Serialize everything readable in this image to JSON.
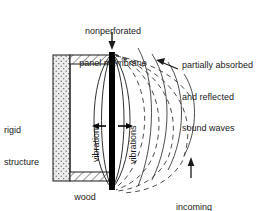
{
  "figure": {
    "title_label": "nonperforated\npanel membrane",
    "background_color": "#ffffff",
    "line_color": "#1a1a1a",
    "membrane_color": "#000000",
    "structure_fill": "#e8e8e8"
  },
  "labels": {
    "membrane": {
      "line1": "nonperforated",
      "line2": "panel membrane"
    },
    "reflected": {
      "line1": "partially absorbed",
      "line2": "and reflected",
      "line3": "sound waves"
    },
    "rigid": {
      "line1": "rigid",
      "line2": "structure"
    },
    "incoming": {
      "line1": "incoming",
      "line2": "sound waves"
    },
    "wood": "wood",
    "vibrations_left": "vibrations",
    "vibrations_right": "vibrations"
  },
  "components": {
    "rigid_structure": "rigid-structure-wall",
    "wood_top": "wood-frame-top",
    "wood_bottom": "wood-frame-bottom",
    "membrane": "panel-membrane-bar",
    "cavity": "air-cavity",
    "vibration_arrow": "vibration-double-arrow",
    "reflected_waves": "dashed-wave-arcs",
    "incoming_waves": "solid-wave-arcs",
    "membrane_pointer": "membrane-arrow-down",
    "reflected_pointer": "reflected-arrow",
    "incoming_pointer": "incoming-arrow-up"
  },
  "counts": {
    "reflected_arcs": 5,
    "incoming_arcs": 4,
    "membrane_ellipses": 4
  }
}
